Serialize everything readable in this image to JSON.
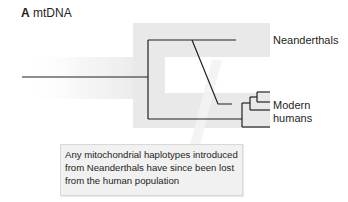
{
  "panel": {
    "letter": "A",
    "title": "mtDNA"
  },
  "labels": {
    "neanderthals": "Neanderthals",
    "modern_line1": "Modern",
    "modern_line2": "humans"
  },
  "callout": {
    "text": "Any mitochondrial haplotypes introduced from Neanderthals have since been lost from the human population"
  },
  "colors": {
    "line": "#231f20",
    "shading": "#e8e8e8",
    "callout_bg": "#f1f1f1",
    "callout_border": "#d8d8d8"
  }
}
